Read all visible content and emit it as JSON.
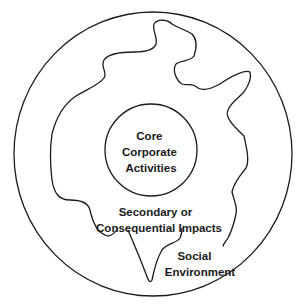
{
  "diagram": {
    "type": "nested-zones",
    "zones": [
      {
        "id": "core",
        "shape": "circle",
        "lines": [
          "Core",
          "Corporate",
          "Activities"
        ]
      },
      {
        "id": "secondary",
        "shape": "irregular-blob",
        "lines": [
          "Secondary or",
          "Consequential Impacts"
        ]
      },
      {
        "id": "social",
        "shape": "circle",
        "lines": [
          "Social",
          "Environment"
        ]
      }
    ],
    "colors": {
      "stroke": "#1a1a1a",
      "background": "#ffffff",
      "text": "#1a1a1a"
    }
  }
}
